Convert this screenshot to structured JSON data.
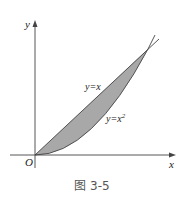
{
  "figure": {
    "caption": "图 3-5",
    "axis_x_label": "x",
    "axis_y_label": "y",
    "origin_label": "O",
    "curve1_label": "y=x",
    "curve2_label": "y=x",
    "curve2_exponent": "2",
    "fill_color": "#a8a8a8",
    "line_color": "#444444"
  }
}
